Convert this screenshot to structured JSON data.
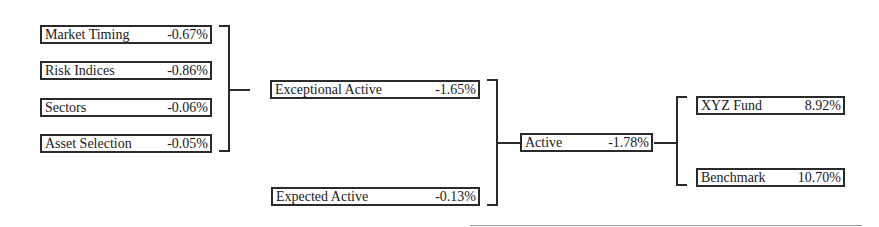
{
  "diagram": {
    "title": "",
    "level1": [
      {
        "label": "Market Timing",
        "value": "-0.67%"
      },
      {
        "label": "Risk Indices",
        "value": "-0.86%"
      },
      {
        "label": "Sectors",
        "value": "-0.06%"
      },
      {
        "label": "Asset Selection",
        "value": "-0.05%"
      }
    ],
    "level2": [
      {
        "label": "Exceptional Active",
        "value": "-1.65%"
      },
      {
        "label": "Expected Active",
        "value": "-0.13%"
      }
    ],
    "level3": {
      "label": "Active",
      "value": "-1.78%"
    },
    "level4": [
      {
        "label": "XYZ Fund",
        "value": "8.92%"
      },
      {
        "label": "Benchmark",
        "value": "10.70%"
      }
    ]
  }
}
